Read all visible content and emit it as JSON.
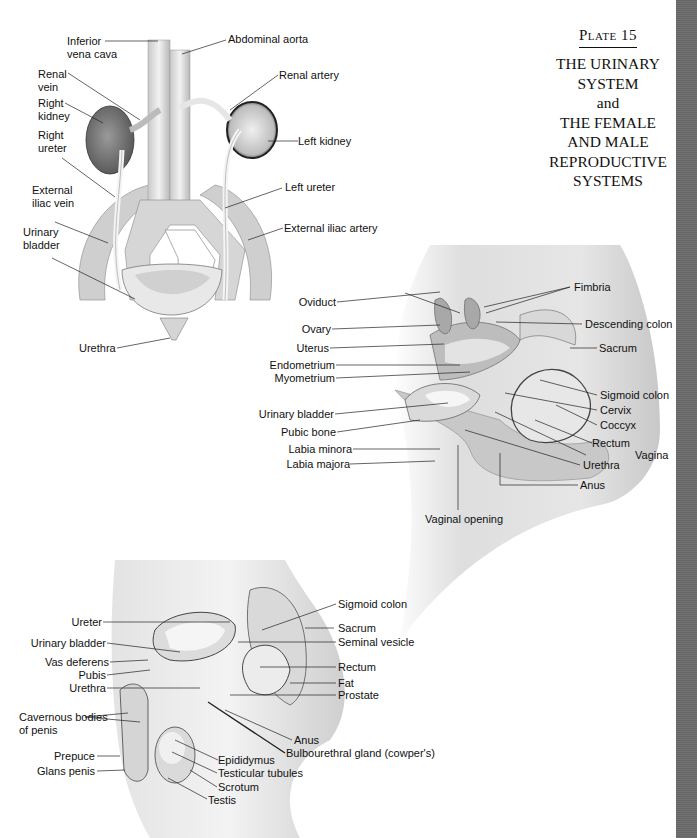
{
  "plate": {
    "number_label": "Plate",
    "number": "15",
    "title_lines": [
      "THE URINARY",
      "SYSTEM",
      "and",
      "THE FEMALE",
      "AND MALE",
      "REPRODUCTIVE",
      "SYSTEMS"
    ]
  },
  "figures": {
    "urinary": {
      "labels": {
        "inferior_vena_cava": "Inferior\nvena cava",
        "abdominal_aorta": "Abdominal aorta",
        "renal_vein": "Renal\nvein",
        "renal_artery": "Renal artery",
        "right_kidney": "Right\nkidney",
        "left_kidney": "Left kidney",
        "right_ureter": "Right\nureter",
        "left_ureter": "Left ureter",
        "external_iliac_vein": "External\niliac vein",
        "external_iliac_artery": "External iliac artery",
        "urinary_bladder": "Urinary\nbladder",
        "urethra": "Urethra"
      }
    },
    "female": {
      "labels": {
        "oviduct": "Oviduct",
        "fimbria": "Fimbria",
        "ovary": "Ovary",
        "descending_colon": "Descending colon",
        "uterus": "Uterus",
        "sacrum": "Sacrum",
        "endometrium": "Endometrium",
        "myometrium": "Myometrium",
        "sigmoid_colon": "Sigmoid colon",
        "urinary_bladder": "Urinary bladder",
        "cervix": "Cervix",
        "coccyx": "Coccyx",
        "pubic_bone": "Pubic bone",
        "rectum": "Rectum",
        "labia_minora": "Labia minora",
        "vagina": "Vagina",
        "labia_majora": "Labia majora",
        "urethra": "Urethra",
        "anus": "Anus",
        "vaginal_opening": "Vaginal opening"
      }
    },
    "male": {
      "labels": {
        "sigmoid_colon": "Sigmoid colon",
        "ureter": "Ureter",
        "sacrum": "Sacrum",
        "urinary_bladder": "Urinary bladder",
        "seminal_vesicle": "Seminal vesicle",
        "vas_deferens": "Vas deferens",
        "rectum": "Rectum",
        "pubis": "Pubis",
        "fat": "Fat",
        "urethra": "Urethra",
        "prostate": "Prostate",
        "cavernous_bodies": "Cavernous bodies\nof penis",
        "anus": "Anus",
        "bulbourethral_gland": "Bulbourethral gland (cowper's)",
        "prepuce": "Prepuce",
        "epididymus": "Epididymus",
        "glans_penis": "Glans penis",
        "testicular_tubules": "Testicular tubules",
        "scrotum": "Scrotum",
        "testis": "Testis"
      }
    }
  },
  "colors": {
    "edge_bar": "#6b6b6b",
    "ink": "#111111"
  }
}
